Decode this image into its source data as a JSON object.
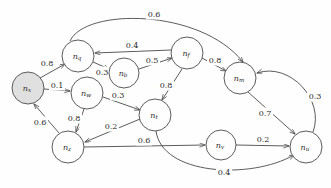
{
  "diagram": {
    "type": "directed-weighted-graph",
    "canvas": {
      "width": 331,
      "height": 188,
      "background": "#fefefe"
    },
    "style": {
      "stroke": "#4a4a4a",
      "node_fill": "#fefefe",
      "start_node_fill": "#e0e0e0",
      "label_color": "#2a2a2a",
      "node_radius": 15
    },
    "nodes": [
      {
        "id": "x",
        "base": "n",
        "sub": "x",
        "cx": 28,
        "cy": 88,
        "r": 16,
        "highlighted": true
      },
      {
        "id": "q",
        "base": "n",
        "sub": "q",
        "cx": 78,
        "cy": 56,
        "r": 16,
        "highlighted": false
      },
      {
        "id": "b",
        "base": "n",
        "sub": "b",
        "cx": 124,
        "cy": 73,
        "r": 15,
        "highlighted": false
      },
      {
        "id": "f",
        "base": "n",
        "sub": "f",
        "cx": 187,
        "cy": 53,
        "r": 16,
        "highlighted": false
      },
      {
        "id": "m",
        "base": "n",
        "sub": "m",
        "cx": 240,
        "cy": 78,
        "r": 16,
        "highlighted": false
      },
      {
        "id": "w",
        "base": "n",
        "sub": "w",
        "cx": 87,
        "cy": 93,
        "r": 16,
        "highlighted": false
      },
      {
        "id": "t",
        "base": "n",
        "sub": "t",
        "cx": 155,
        "cy": 115,
        "r": 16,
        "highlighted": false
      },
      {
        "id": "z",
        "base": "n",
        "sub": "z",
        "cx": 68,
        "cy": 147,
        "r": 16,
        "highlighted": false
      },
      {
        "id": "v",
        "base": "n",
        "sub": "v",
        "cx": 221,
        "cy": 145,
        "r": 15,
        "highlighted": false
      },
      {
        "id": "u",
        "base": "n",
        "sub": "u",
        "cx": 306,
        "cy": 147,
        "r": 16,
        "highlighted": false
      }
    ],
    "edges": [
      {
        "from": "q",
        "to": "m",
        "weight": "0.6",
        "path": "M 70,41 C 85,8 200,8 243,62",
        "label_x": 154,
        "label_y": 14
      },
      {
        "from": "f",
        "to": "q",
        "weight": "0.4",
        "path": "M 171,50 L 95,53",
        "label_x": 132,
        "label_y": 45
      },
      {
        "from": "q",
        "to": "b",
        "weight": "0.3",
        "path": "M 93,62 L 109,69",
        "label_x": 102,
        "label_y": 72
      },
      {
        "from": "b",
        "to": "f",
        "weight": "0.5",
        "path": "M 139,69 L 172,58",
        "label_x": 152,
        "label_y": 60
      },
      {
        "from": "f",
        "to": "m",
        "weight": "0.8",
        "path": "M 202,58 L 226,71",
        "label_x": 215,
        "label_y": 60
      },
      {
        "from": "x",
        "to": "q",
        "weight": "0.8",
        "path": "M 40,78 L 65,64",
        "label_x": 47,
        "label_y": 63
      },
      {
        "from": "x",
        "to": "w",
        "weight": "0.1",
        "path": "M 44,89 L 70,91",
        "label_x": 57,
        "label_y": 85
      },
      {
        "from": "w",
        "to": "t",
        "weight": "0.3",
        "path": "M 103,97 L 140,110",
        "label_x": 118,
        "label_y": 95
      },
      {
        "from": "f",
        "to": "t",
        "weight": "0.8",
        "path": "M 182,69 L 162,100",
        "label_x": 166,
        "label_y": 85
      },
      {
        "from": "w",
        "to": "z",
        "weight": "0.8",
        "path": "M 84,109 L 76,132",
        "label_x": 74,
        "label_y": 118
      },
      {
        "from": "z",
        "to": "x",
        "weight": "0.6",
        "path": "M 59,133 L 34,104",
        "label_x": 40,
        "label_y": 122
      },
      {
        "from": "t",
        "to": "z",
        "weight": "0.2",
        "path": "M 140,119 L 85,142",
        "label_x": 111,
        "label_y": 126
      },
      {
        "from": "z",
        "to": "v",
        "weight": "0.6",
        "path": "M 84,147 L 205,145",
        "label_x": 144,
        "label_y": 140
      },
      {
        "from": "v",
        "to": "u",
        "weight": "0.2",
        "path": "M 236,145 L 289,146",
        "label_x": 263,
        "label_y": 139
      },
      {
        "from": "m",
        "to": "u",
        "weight": "0.7",
        "path": "M 248,92 L 295,134",
        "label_x": 265,
        "label_y": 113
      },
      {
        "from": "u",
        "to": "m",
        "weight": "0.3",
        "path": "M 313,132 C 325,100 290,62 257,73",
        "label_x": 315,
        "label_y": 96
      },
      {
        "from": "t",
        "to": "u",
        "weight": "0.4",
        "path": "M 156,131 C 162,175 250,180 294,155",
        "label_x": 224,
        "label_y": 172
      }
    ]
  }
}
